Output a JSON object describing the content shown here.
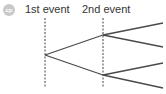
{
  "badge": {
    "text": "cp",
    "color": "#c9c9c9"
  },
  "labels": {
    "first_event": "1st event",
    "second_event": "2nd event"
  },
  "diagram": {
    "type": "tree-diagram",
    "line_color": "#4a4a4a",
    "root": [
      45,
      55
    ],
    "level1_nodes": [
      [
        103,
        35
      ],
      [
        103,
        75
      ]
    ],
    "leaves": [
      [
        163,
        23
      ],
      [
        163,
        47
      ],
      [
        163,
        63
      ],
      [
        163,
        88
      ]
    ]
  }
}
